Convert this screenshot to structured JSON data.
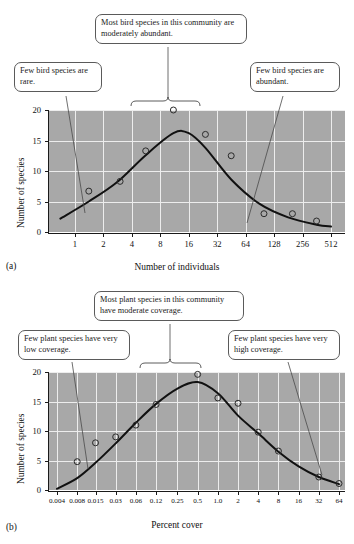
{
  "figure": {
    "panels": [
      {
        "id": "a",
        "panel_label": "(a)",
        "callouts": [
          {
            "name": "callout-rare",
            "text": "Few bird species are rare."
          },
          {
            "name": "callout-moderate",
            "text": "Most bird species in this community are moderately abundant."
          },
          {
            "name": "callout-abundant",
            "text": "Few bird species are abundant."
          }
        ]
      },
      {
        "id": "b",
        "panel_label": "(b)",
        "callouts": [
          {
            "name": "callout-low-coverage",
            "text": "Few plant species have very low coverage."
          },
          {
            "name": "callout-moderate-coverage",
            "text": "Most plant species in this community have moderate coverage."
          },
          {
            "name": "callout-high-coverage",
            "text": "Few plant species have very high coverage."
          }
        ]
      }
    ]
  },
  "chart_data": [
    {
      "type": "scatter",
      "id": "a",
      "title": "",
      "xlabel": "Number of individuals",
      "ylabel": "Number of species",
      "xscale": "log2",
      "xticks": [
        "1",
        "2",
        "4",
        "8",
        "16",
        "32",
        "64",
        "128",
        "256",
        "512"
      ],
      "xtick_values": [
        1,
        2,
        4,
        8,
        16,
        32,
        64,
        128,
        256,
        512
      ],
      "yticks": [
        "0",
        "5",
        "10",
        "15",
        "20"
      ],
      "ylim": [
        0,
        20
      ],
      "grid": true,
      "series": [
        {
          "name": "observed species counts",
          "marker": "open-circle",
          "points": [
            {
              "x": 1.4,
              "y": 6.7
            },
            {
              "x": 3.0,
              "y": 8.3
            },
            {
              "x": 5.6,
              "y": 13.3
            },
            {
              "x": 11.0,
              "y": 20.0
            },
            {
              "x": 24.0,
              "y": 16.0
            },
            {
              "x": 45.0,
              "y": 12.5
            },
            {
              "x": 100.0,
              "y": 3.0
            },
            {
              "x": 200.0,
              "y": 3.0
            },
            {
              "x": 360.0,
              "y": 1.8
            }
          ]
        },
        {
          "name": "fitted lognormal curve",
          "marker": "line",
          "points": [
            {
              "x": 0.7,
              "y": 2.2
            },
            {
              "x": 1.4,
              "y": 5.0
            },
            {
              "x": 2.8,
              "y": 8.2
            },
            {
              "x": 5.6,
              "y": 12.6
            },
            {
              "x": 11.0,
              "y": 16.2
            },
            {
              "x": 16.0,
              "y": 16.2
            },
            {
              "x": 24.0,
              "y": 13.8
            },
            {
              "x": 45.0,
              "y": 8.6
            },
            {
              "x": 90.0,
              "y": 4.6
            },
            {
              "x": 180.0,
              "y": 2.4
            },
            {
              "x": 360.0,
              "y": 1.2
            },
            {
              "x": 512.0,
              "y": 0.9
            }
          ]
        }
      ],
      "annotations": [
        "Few bird species are rare.",
        "Most bird species in this community are moderately abundant.",
        "Few bird species are abundant."
      ]
    },
    {
      "type": "scatter",
      "id": "b",
      "title": "",
      "xlabel": "Percent cover",
      "ylabel": "Number of species",
      "xscale": "log2",
      "xticks": [
        "0.004",
        "0.008",
        "0.015",
        "0.03",
        "0.06",
        "0.12",
        "0.25",
        "0.5",
        "1.0",
        "2",
        "4",
        "8",
        "16",
        "32",
        "64"
      ],
      "xtick_values": [
        0.004,
        0.008,
        0.015,
        0.03,
        0.06,
        0.12,
        0.25,
        0.5,
        1.0,
        2,
        4,
        8,
        16,
        32,
        64
      ],
      "yticks": [
        "0",
        "5",
        "10",
        "15",
        "20"
      ],
      "ylim": [
        0,
        20
      ],
      "grid": true,
      "series": [
        {
          "name": "observed species counts",
          "marker": "open-circle",
          "points": [
            {
              "x": 0.008,
              "y": 4.8
            },
            {
              "x": 0.015,
              "y": 8.0
            },
            {
              "x": 0.03,
              "y": 9.0
            },
            {
              "x": 0.06,
              "y": 11.0
            },
            {
              "x": 0.12,
              "y": 14.5
            },
            {
              "x": 0.5,
              "y": 19.6
            },
            {
              "x": 1.0,
              "y": 15.6
            },
            {
              "x": 2.0,
              "y": 14.7
            },
            {
              "x": 4.0,
              "y": 9.8
            },
            {
              "x": 8.0,
              "y": 6.6
            },
            {
              "x": 32.0,
              "y": 2.2
            },
            {
              "x": 64.0,
              "y": 1.1
            }
          ]
        },
        {
          "name": "fitted lognormal curve",
          "marker": "line",
          "points": [
            {
              "x": 0.004,
              "y": 0.2
            },
            {
              "x": 0.008,
              "y": 2.0
            },
            {
              "x": 0.015,
              "y": 4.6
            },
            {
              "x": 0.03,
              "y": 7.9
            },
            {
              "x": 0.06,
              "y": 11.4
            },
            {
              "x": 0.12,
              "y": 14.6
            },
            {
              "x": 0.25,
              "y": 17.2
            },
            {
              "x": 0.5,
              "y": 18.3
            },
            {
              "x": 1.0,
              "y": 16.4
            },
            {
              "x": 2.0,
              "y": 12.6
            },
            {
              "x": 4.0,
              "y": 9.6
            },
            {
              "x": 8.0,
              "y": 6.5
            },
            {
              "x": 16.0,
              "y": 4.0
            },
            {
              "x": 32.0,
              "y": 2.2
            },
            {
              "x": 64.0,
              "y": 1.0
            }
          ]
        }
      ],
      "annotations": [
        "Few plant species have very low coverage.",
        "Most plant species in this community have moderate coverage.",
        "Few plant species have very high coverage."
      ]
    }
  ]
}
